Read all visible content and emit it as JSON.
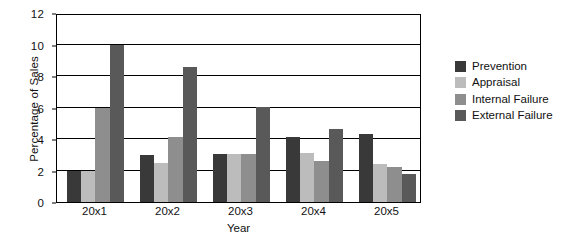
{
  "chart_data": {
    "type": "bar",
    "title": "",
    "xlabel": "Year",
    "ylabel": "Percentage of Sales",
    "categories": [
      "20x1",
      "20x2",
      "20x3",
      "20x4",
      "20x5"
    ],
    "ylim": [
      0,
      12
    ],
    "yticks": [
      0,
      2,
      4,
      6,
      8,
      10,
      12
    ],
    "grid": true,
    "legend_position": "right",
    "series": [
      {
        "name": "Prevention",
        "color": "#393939",
        "values": [
          2.0,
          3.0,
          3.05,
          4.1,
          4.35
        ]
      },
      {
        "name": "Appraisal",
        "color": "#bcbcbc",
        "values": [
          2.0,
          2.5,
          3.05,
          3.1,
          2.4
        ]
      },
      {
        "name": "Internal Failure",
        "color": "#8e8e8e",
        "values": [
          6.0,
          4.1,
          3.05,
          2.6,
          2.2
        ]
      },
      {
        "name": "External Failure",
        "color": "#595959",
        "values": [
          10.0,
          8.6,
          6.05,
          4.65,
          1.75
        ]
      }
    ]
  },
  "legend": {
    "items": [
      {
        "label": "Prevention"
      },
      {
        "label": "Appraisal"
      },
      {
        "label": "Internal Failure"
      },
      {
        "label": "External Failure"
      }
    ]
  },
  "axes": {
    "y_title": "Percentage of Sales",
    "x_title": "Year"
  }
}
